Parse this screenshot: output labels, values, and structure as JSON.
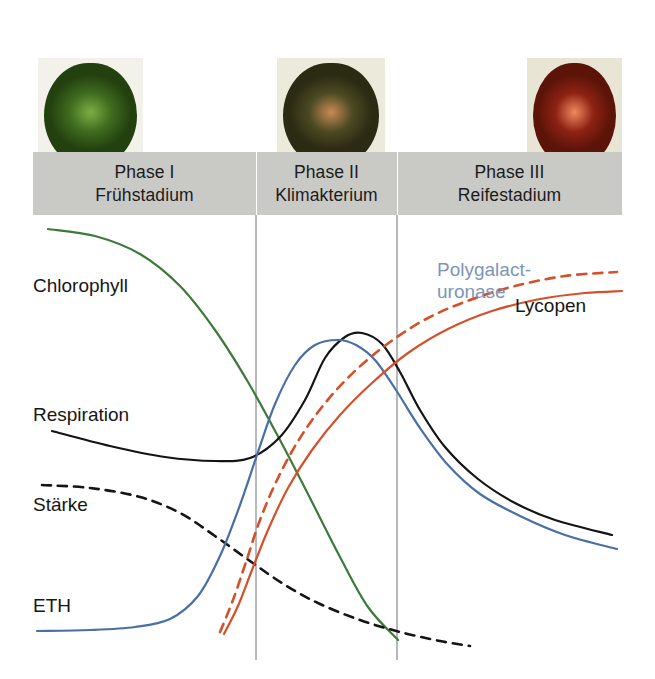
{
  "figure": {
    "background": "#ffffff"
  },
  "photos": [
    {
      "name": "unripe-green-tomato",
      "stage_label": "Phase I",
      "fruit_color": "#3f6b1f",
      "fruit_color_dark": "#23410f",
      "fruit_highlight": "#7cae44",
      "plate_color": "#f3f2ea"
    },
    {
      "name": "turning-tomato",
      "stage_label": "Phase II",
      "fruit_color": "#4b4a22",
      "fruit_color_dark": "#2b2a13",
      "fruit_highlight": "#c98a54",
      "plate_color": "#eceadb"
    },
    {
      "name": "ripe-red-tomato",
      "stage_label": "Phase III",
      "fruit_color": "#8e2214",
      "fruit_color_dark": "#5d1408",
      "fruit_highlight": "#f08a5c",
      "plate_color": "#e9e5d4"
    }
  ],
  "phases": {
    "band_color": "#c9cac6",
    "divider_color": "#ffffff",
    "items": [
      {
        "title": "Phase I",
        "subtitle": "Frühstadium"
      },
      {
        "title": "Phase II",
        "subtitle": "Klimakterium"
      },
      {
        "title": "Phase III",
        "subtitle": "Reifestadium"
      }
    ]
  },
  "chart_data": {
    "type": "line",
    "title": "",
    "xlabel": "",
    "ylabel": "",
    "grid": false,
    "legend": "inline-labels",
    "xlim": [
      33,
      622
    ],
    "ylim": [
      679,
      215
    ],
    "phase_boundaries_x": [
      256,
      397
    ],
    "series": [
      {
        "name": "Chlorophyll",
        "color": "#3d7a3a",
        "style": "solid",
        "label_position": "left-upper",
        "description": "High in Phase I, falls steeply through the climacteric, near zero in Phase III",
        "points": [
          [
            48,
            229
          ],
          [
            95,
            236
          ],
          [
            140,
            254
          ],
          [
            180,
            286
          ],
          [
            215,
            330
          ],
          [
            248,
            382
          ],
          [
            280,
            440
          ],
          [
            310,
            498
          ],
          [
            340,
            557
          ],
          [
            368,
            607
          ],
          [
            398,
            640
          ]
        ]
      },
      {
        "name": "Respiration",
        "color": "#141414",
        "style": "solid",
        "label_position": "left-middle",
        "description": "Gentle decline, then a sharp climacteric peak in Phase II, then decline",
        "points": [
          [
            52,
            431
          ],
          [
            110,
            446
          ],
          [
            165,
            457
          ],
          [
            215,
            461
          ],
          [
            250,
            458
          ],
          [
            280,
            437
          ],
          [
            305,
            400
          ],
          [
            325,
            358
          ],
          [
            345,
            337
          ],
          [
            362,
            333
          ],
          [
            382,
            344
          ],
          [
            400,
            372
          ],
          [
            420,
            410
          ],
          [
            445,
            447
          ],
          [
            478,
            479
          ],
          [
            515,
            503
          ],
          [
            555,
            520
          ],
          [
            612,
            535
          ]
        ]
      },
      {
        "name": "Stärke",
        "color": "#141414",
        "style": "dashed",
        "label_position": "left-lower",
        "description": "Starch slowly declines, then drops steeply during ripening",
        "points": [
          [
            42,
            485
          ],
          [
            90,
            488
          ],
          [
            140,
            497
          ],
          [
            180,
            513
          ],
          [
            215,
            536
          ],
          [
            250,
            561
          ],
          [
            285,
            585
          ],
          [
            320,
            604
          ],
          [
            360,
            620
          ],
          [
            400,
            632
          ],
          [
            440,
            641
          ],
          [
            470,
            646
          ]
        ]
      },
      {
        "name": "ETH",
        "color": "#4a6fa5",
        "style": "solid",
        "label_position": "left-bottom",
        "description": "Ethylene is flat and low in Phase I, surges to a peak in Phase II, then falls",
        "points": [
          [
            37,
            631
          ],
          [
            90,
            630
          ],
          [
            135,
            627
          ],
          [
            170,
            619
          ],
          [
            198,
            596
          ],
          [
            220,
            556
          ],
          [
            240,
            505
          ],
          [
            258,
            452
          ],
          [
            275,
            404
          ],
          [
            295,
            365
          ],
          [
            315,
            345
          ],
          [
            338,
            340
          ],
          [
            356,
            345
          ],
          [
            375,
            360
          ],
          [
            396,
            390
          ],
          [
            420,
            428
          ],
          [
            448,
            465
          ],
          [
            480,
            494
          ],
          [
            520,
            516
          ],
          [
            565,
            535
          ],
          [
            617,
            549
          ]
        ]
      },
      {
        "name": "Lycopen",
        "color": "#d4502a",
        "style": "solid",
        "label_position": "right-middle",
        "description": "Lycopene accumulates from the climacteric onward, plateauing in Phase III",
        "points": [
          [
            224,
            634
          ],
          [
            238,
            606
          ],
          [
            252,
            570
          ],
          [
            268,
            530
          ],
          [
            288,
            488
          ],
          [
            312,
            450
          ],
          [
            340,
            415
          ],
          [
            372,
            383
          ],
          [
            408,
            353
          ],
          [
            448,
            329
          ],
          [
            492,
            311
          ],
          [
            540,
            299
          ],
          [
            585,
            293
          ],
          [
            622,
            291
          ]
        ]
      },
      {
        "name": "Polygalacturonase",
        "color": "#d4502a",
        "style": "dashed",
        "label_color": "#7d95b8",
        "label_position": "right-upper",
        "description": "Cell-wall enzyme rises just ahead of lycopene and saturates in Phase III",
        "points": [
          [
            220,
            632
          ],
          [
            233,
            600
          ],
          [
            246,
            562
          ],
          [
            260,
            520
          ],
          [
            278,
            478
          ],
          [
            300,
            438
          ],
          [
            326,
            402
          ],
          [
            356,
            370
          ],
          [
            390,
            342
          ],
          [
            428,
            318
          ],
          [
            470,
            300
          ],
          [
            515,
            286
          ],
          [
            565,
            276
          ],
          [
            617,
            272
          ]
        ]
      }
    ]
  },
  "labels": {
    "chlorophyll": "Chlorophyll",
    "respiration": "Respiration",
    "staerke": "Stärke",
    "eth": "ETH",
    "lycopen": "Lycopen",
    "polygalacturonase_line1": "Polygalact-",
    "polygalacturonase_line2": "uronase"
  }
}
